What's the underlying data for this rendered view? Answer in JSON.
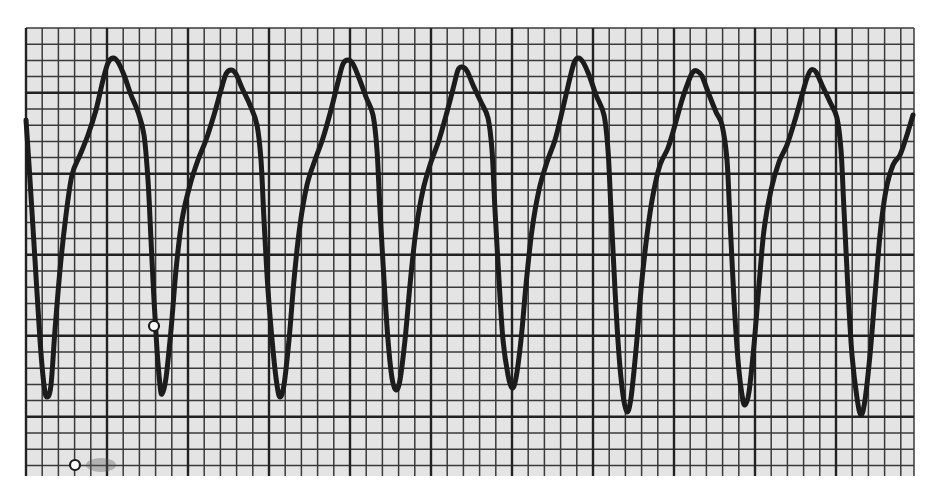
{
  "figure": {
    "colors": {
      "paper": "#e4e4e4",
      "page": "#ffffff",
      "minor_grid": "#3a3a3a",
      "major_grid": "#222222",
      "trace": "#1c1c1c"
    },
    "grid": {
      "left": 26,
      "top": 28,
      "right": 914,
      "bottom": 476,
      "cell": 16.2,
      "major_every": 5,
      "major_col_offset": 5,
      "major_row_offset": 4
    },
    "trace_points": [
      [
        26,
        120
      ],
      [
        30,
        180
      ],
      [
        35,
        260
      ],
      [
        40,
        340
      ],
      [
        44,
        385
      ],
      [
        47,
        397
      ],
      [
        51,
        385
      ],
      [
        55,
        330
      ],
      [
        60,
        270
      ],
      [
        66,
        215
      ],
      [
        72,
        175
      ],
      [
        80,
        155
      ],
      [
        88,
        135
      ],
      [
        96,
        110
      ],
      [
        103,
        80
      ],
      [
        108,
        63
      ],
      [
        113,
        58
      ],
      [
        118,
        62
      ],
      [
        124,
        75
      ],
      [
        131,
        95
      ],
      [
        138,
        112
      ],
      [
        144,
        135
      ],
      [
        148,
        180
      ],
      [
        151,
        240
      ],
      [
        154,
        300
      ],
      [
        157,
        350
      ],
      [
        160,
        385
      ],
      [
        162,
        394
      ],
      [
        166,
        378
      ],
      [
        171,
        330
      ],
      [
        176,
        270
      ],
      [
        182,
        220
      ],
      [
        190,
        185
      ],
      [
        198,
        160
      ],
      [
        206,
        140
      ],
      [
        214,
        115
      ],
      [
        221,
        90
      ],
      [
        226,
        74
      ],
      [
        231,
        70
      ],
      [
        236,
        74
      ],
      [
        242,
        88
      ],
      [
        250,
        105
      ],
      [
        257,
        125
      ],
      [
        261,
        160
      ],
      [
        264,
        220
      ],
      [
        268,
        290
      ],
      [
        273,
        350
      ],
      [
        277,
        385
      ],
      [
        280,
        397
      ],
      [
        284,
        385
      ],
      [
        289,
        340
      ],
      [
        294,
        280
      ],
      [
        300,
        225
      ],
      [
        307,
        185
      ],
      [
        315,
        160
      ],
      [
        323,
        138
      ],
      [
        331,
        110
      ],
      [
        338,
        82
      ],
      [
        343,
        64
      ],
      [
        348,
        60
      ],
      [
        353,
        64
      ],
      [
        359,
        78
      ],
      [
        366,
        97
      ],
      [
        373,
        115
      ],
      [
        377,
        150
      ],
      [
        380,
        210
      ],
      [
        384,
        280
      ],
      [
        388,
        340
      ],
      [
        392,
        378
      ],
      [
        396,
        390
      ],
      [
        400,
        380
      ],
      [
        405,
        340
      ],
      [
        410,
        285
      ],
      [
        416,
        230
      ],
      [
        423,
        190
      ],
      [
        431,
        162
      ],
      [
        439,
        140
      ],
      [
        447,
        112
      ],
      [
        454,
        85
      ],
      [
        458,
        70
      ],
      [
        462,
        67
      ],
      [
        467,
        71
      ],
      [
        473,
        85
      ],
      [
        481,
        102
      ],
      [
        488,
        118
      ],
      [
        492,
        150
      ],
      [
        495,
        210
      ],
      [
        499,
        280
      ],
      [
        503,
        340
      ],
      [
        508,
        375
      ],
      [
        512,
        388
      ],
      [
        516,
        378
      ],
      [
        521,
        340
      ],
      [
        526,
        285
      ],
      [
        532,
        230
      ],
      [
        539,
        190
      ],
      [
        547,
        162
      ],
      [
        555,
        140
      ],
      [
        562,
        112
      ],
      [
        569,
        82
      ],
      [
        574,
        63
      ],
      [
        578,
        58
      ],
      [
        583,
        62
      ],
      [
        589,
        75
      ],
      [
        596,
        95
      ],
      [
        604,
        115
      ],
      [
        608,
        150
      ],
      [
        611,
        210
      ],
      [
        615,
        290
      ],
      [
        619,
        355
      ],
      [
        623,
        395
      ],
      [
        627,
        412
      ],
      [
        631,
        398
      ],
      [
        636,
        350
      ],
      [
        641,
        290
      ],
      [
        647,
        235
      ],
      [
        653,
        195
      ],
      [
        660,
        165
      ],
      [
        668,
        148
      ],
      [
        675,
        125
      ],
      [
        682,
        100
      ],
      [
        689,
        80
      ],
      [
        693,
        72
      ],
      [
        697,
        71
      ],
      [
        702,
        76
      ],
      [
        708,
        92
      ],
      [
        716,
        112
      ],
      [
        722,
        125
      ],
      [
        727,
        160
      ],
      [
        730,
        220
      ],
      [
        734,
        300
      ],
      [
        738,
        360
      ],
      [
        742,
        395
      ],
      [
        745,
        405
      ],
      [
        749,
        392
      ],
      [
        754,
        345
      ],
      [
        759,
        285
      ],
      [
        764,
        230
      ],
      [
        771,
        190
      ],
      [
        779,
        162
      ],
      [
        787,
        145
      ],
      [
        795,
        120
      ],
      [
        802,
        95
      ],
      [
        807,
        78
      ],
      [
        811,
        70
      ],
      [
        816,
        72
      ],
      [
        822,
        85
      ],
      [
        830,
        102
      ],
      [
        837,
        118
      ],
      [
        841,
        150
      ],
      [
        844,
        210
      ],
      [
        848,
        290
      ],
      [
        852,
        355
      ],
      [
        857,
        398
      ],
      [
        861,
        415
      ],
      [
        865,
        400
      ],
      [
        870,
        355
      ],
      [
        875,
        295
      ],
      [
        880,
        235
      ],
      [
        886,
        190
      ],
      [
        893,
        165
      ],
      [
        900,
        155
      ],
      [
        906,
        138
      ],
      [
        910,
        125
      ],
      [
        913,
        115
      ]
    ],
    "markers": [
      {
        "name": "circle-marker-1",
        "cx": 154,
        "cy": 326,
        "r": 5
      },
      {
        "name": "circle-marker-2",
        "cx": 75,
        "cy": 465,
        "r": 5
      }
    ],
    "smudges": [
      {
        "x": 86,
        "y": 458,
        "w": 30,
        "h": 14
      }
    ]
  }
}
